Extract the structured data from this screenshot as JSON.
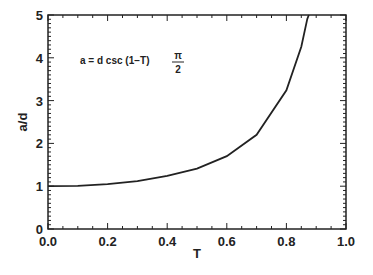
{
  "chart_data": {
    "type": "line",
    "title": "",
    "xlabel": "T",
    "ylabel": "a/d",
    "xlim": [
      0.0,
      1.0
    ],
    "ylim": [
      0,
      5
    ],
    "x_ticks": [
      "0.0",
      "0.2",
      "0.4",
      "0.6",
      "0.8",
      "1.0"
    ],
    "y_ticks": [
      "0",
      "1",
      "2",
      "3",
      "4",
      "5"
    ],
    "grid": false,
    "legend": null,
    "annotation": {
      "text_prefix": "a = d  csc  (1−T)",
      "fraction_num": "π",
      "fraction_den": "2"
    },
    "series": [
      {
        "name": "a/d = csc((1-T)π/2)",
        "x": [
          0.0,
          0.1,
          0.2,
          0.3,
          0.4,
          0.5,
          0.6,
          0.7,
          0.8,
          0.85,
          0.87
        ],
        "y": [
          1.0,
          1.01,
          1.05,
          1.12,
          1.24,
          1.41,
          1.7,
          2.2,
          3.24,
          4.26,
          4.91
        ]
      }
    ]
  }
}
